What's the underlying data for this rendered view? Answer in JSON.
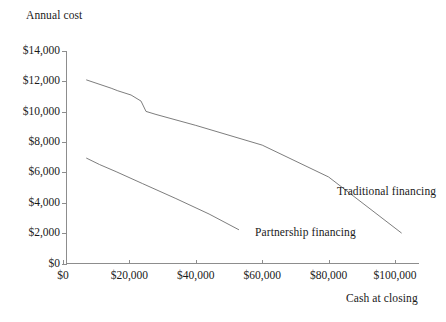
{
  "chart_data": {
    "type": "line",
    "title": "",
    "xlabel": "Cash at closing",
    "ylabel": "Annual cost",
    "xlim": [
      0,
      110000
    ],
    "ylim": [
      0,
      14000
    ],
    "grid": false,
    "legend_position": "inline-annotations",
    "x_ticks": [
      0,
      20000,
      40000,
      60000,
      80000,
      100000
    ],
    "x_tick_labels": [
      "$0",
      "$20,000",
      "$40,000",
      "$60,000",
      "$80,000",
      "$100,000"
    ],
    "y_ticks": [
      0,
      2000,
      4000,
      6000,
      8000,
      10000,
      12000,
      14000
    ],
    "y_tick_labels": [
      "$0",
      "$2,000",
      "$4,000",
      "$6,000",
      "$8,000",
      "$10,000",
      "$12,000",
      "$14,000"
    ],
    "series": [
      {
        "name": "Traditional financing",
        "label": "Traditional financing",
        "color": "#6e6e6e",
        "x": [
          7000,
          14500,
          16500,
          20500,
          23500,
          25000,
          28000,
          40000,
          60000,
          80000,
          102000
        ],
        "y": [
          12100,
          11550,
          11380,
          11100,
          10700,
          10020,
          9820,
          9100,
          7800,
          5700,
          2000
        ]
      },
      {
        "name": "Partnership financing",
        "label": "Partnership financing",
        "color": "#6e6e6e",
        "x": [
          7000,
          11000,
          16000,
          24000,
          34000,
          44000,
          53000
        ],
        "y": [
          6950,
          6520,
          6050,
          5260,
          4280,
          3260,
          2220
        ]
      }
    ],
    "annotations": [
      {
        "text": "Traditional financing",
        "x": 102000,
        "y": 5200
      },
      {
        "text": "Partnership financing",
        "x": 63000,
        "y": 2550
      }
    ]
  },
  "axes": {
    "y_title": "Annual cost",
    "x_title": "Cash at closing"
  },
  "colors": {
    "axis": "#8d8d8d",
    "line": "#6e6e6e",
    "text": "#1a1a1a",
    "background": "#ffffff"
  }
}
